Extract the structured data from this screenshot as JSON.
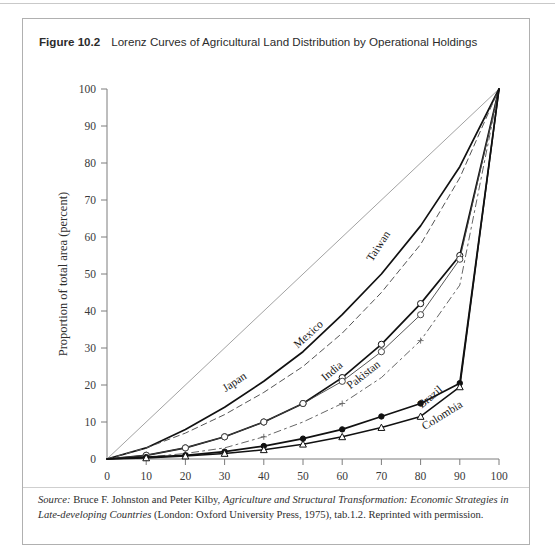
{
  "figure": {
    "label": "Figure 10.2",
    "title": "Lorenz Curves of Agricultural Land Distribution by Operational Holdings"
  },
  "source": {
    "prefix": "Source:",
    "line1_plain_a": " Bruce F. Johnston and Peter Kilby, ",
    "line1_italic": "Agriculture and Structural Transformation: Economic Strategies in Late-developing Countries",
    "line1_plain_b": " (London: Oxford University Press, 1975), tab.1.2. Reprinted with permission."
  },
  "chart_data": {
    "type": "line",
    "title": "Lorenz Curves of Agricultural Land Distribution by Operational Holdings",
    "xlabel": "Proportion of total holdings (percent)",
    "ylabel": "Proportion of total area (percent)",
    "xlim": [
      0,
      100
    ],
    "ylim": [
      0,
      100
    ],
    "xticks": [
      0,
      10,
      20,
      30,
      40,
      50,
      60,
      70,
      80,
      90,
      100
    ],
    "yticks": [
      0,
      10,
      20,
      30,
      40,
      50,
      60,
      70,
      80,
      90,
      100
    ],
    "grid": false,
    "legend": "inline-curve-labels",
    "equality_line": {
      "name": "line of equality",
      "x": [
        0,
        100
      ],
      "y": [
        0,
        100
      ],
      "style": "thin solid grey"
    },
    "series": [
      {
        "name": "Japan",
        "style": "solid heavy, no markers",
        "label_x": 33,
        "label_y": 20,
        "x": [
          0,
          10,
          20,
          30,
          40,
          50,
          60,
          70,
          80,
          90,
          100
        ],
        "y": [
          0,
          3,
          8,
          14,
          21,
          29,
          39,
          50,
          63,
          79,
          100
        ]
      },
      {
        "name": "Taiwan",
        "style": "dashed thin",
        "label_x": 70,
        "label_y": 57,
        "x": [
          0,
          10,
          20,
          30,
          40,
          50,
          60,
          70,
          80,
          90,
          100
        ],
        "y": [
          0,
          3,
          7,
          12,
          18,
          25,
          34,
          45,
          58,
          76,
          100
        ]
      },
      {
        "name": "Mexico",
        "style": "solid heavy with open circle markers",
        "label_x": 52,
        "label_y": 33,
        "x": [
          0,
          10,
          20,
          30,
          40,
          50,
          60,
          70,
          80,
          90,
          100
        ],
        "y": [
          0,
          1,
          3,
          6,
          10,
          15,
          22,
          31,
          42,
          55,
          100
        ]
      },
      {
        "name": "India",
        "style": "thin solid with open circle markers",
        "label_x": 58,
        "label_y": 23,
        "x": [
          0,
          10,
          20,
          30,
          40,
          50,
          60,
          70,
          80,
          90,
          100
        ],
        "y": [
          0,
          1,
          3,
          6,
          10,
          15,
          21,
          29,
          39,
          54,
          100
        ]
      },
      {
        "name": "Pakistan",
        "style": "dash-dot thin",
        "label_x": 66,
        "label_y": 22,
        "x": [
          0,
          10,
          20,
          30,
          40,
          50,
          60,
          70,
          80,
          90,
          100
        ],
        "y": [
          0,
          0.5,
          1.5,
          3,
          6,
          10,
          15,
          22,
          32,
          47,
          100
        ]
      },
      {
        "name": "Brazil",
        "style": "solid heavy with filled circle markers",
        "label_x": 83,
        "label_y": 16,
        "x": [
          0,
          10,
          20,
          30,
          40,
          50,
          60,
          70,
          80,
          90,
          100
        ],
        "y": [
          0,
          0.5,
          1,
          2,
          3.5,
          5.5,
          8,
          11.5,
          15,
          20.5,
          100
        ]
      },
      {
        "name": "Colombia",
        "style": "solid heavy with open triangle markers",
        "label_x": 86,
        "label_y": 11,
        "x": [
          0,
          10,
          20,
          30,
          40,
          50,
          60,
          70,
          80,
          90,
          100
        ],
        "y": [
          0,
          0.3,
          0.8,
          1.5,
          2.5,
          4,
          6,
          8.5,
          11.5,
          19.5,
          100
        ]
      }
    ]
  }
}
